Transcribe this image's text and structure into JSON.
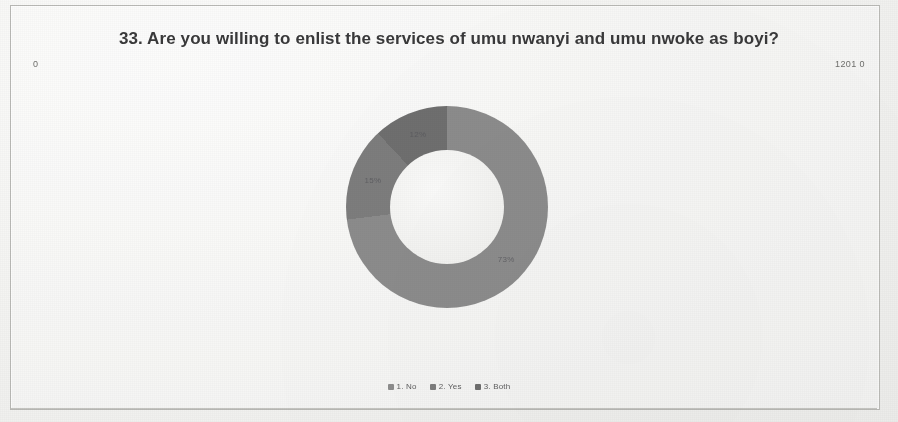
{
  "page": {
    "background_color": "#f2f2f0",
    "frame_border_color": "#b9b9b5"
  },
  "corner_labels": {
    "left": "0",
    "right": "1201 0"
  },
  "chart_title": "33. Are you willing to enlist the services of umu nwanyi and umu nwoke as boyi?",
  "legend": {
    "items": [
      {
        "label": "1. No",
        "color": "#8d8d8d"
      },
      {
        "label": "2. Yes",
        "color": "#7d7d7d"
      },
      {
        "label": "3. Both",
        "color": "#6e6e6e"
      }
    ]
  },
  "chart_data": {
    "type": "pie",
    "variant": "donut",
    "title": "33. Are you willing to enlist the services of umu nwanyi and umu nwoke as boyi?",
    "categories": [
      "1. No",
      "2. Yes",
      "3. Both"
    ],
    "values": [
      73,
      15,
      12
    ],
    "value_unit": "percent",
    "labels": [
      "73%",
      "15%",
      "12%"
    ],
    "colors": [
      "#8d8d8d",
      "#7d7d7d",
      "#6e6e6e"
    ],
    "legend_position": "bottom",
    "start_angle_deg": 0,
    "direction": "clockwise",
    "inner_radius_ratio": 0.565,
    "grid": false,
    "data_labels_visible": true,
    "data_labels_legible": false,
    "note": "Low-resolution scanned figure; in-slice percentage labels are blurred and only approximate."
  }
}
